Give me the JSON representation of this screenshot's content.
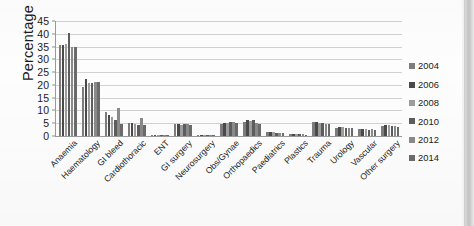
{
  "chart_data": {
    "type": "bar",
    "title": "",
    "xlabel": "",
    "ylabel": "Percentage",
    "ylim": [
      0,
      45
    ],
    "ytick_step": 5,
    "yticks": [
      0,
      5,
      10,
      15,
      20,
      25,
      30,
      35,
      40,
      45
    ],
    "grid": true,
    "legend_position": "right",
    "categories": [
      "Anaemia",
      "Haematology",
      "GI bleed",
      "Cardiothoracic",
      "ENT",
      "GI surgery",
      "Neurosurgery",
      "Obs/Gynae",
      "Orthopaedics",
      "Paediatrics",
      "Plastics",
      "Trauma",
      "Urology",
      "Vascular",
      "Other surgery"
    ],
    "series": [
      {
        "name": "2004",
        "color": "#7d7d7d",
        "values": [
          35.5,
          19.0,
          9.5,
          5.0,
          0.4,
          4.6,
          0.4,
          4.6,
          5.4,
          1.4,
          0.7,
          5.4,
          3.2,
          2.6,
          4.0
        ]
      },
      {
        "name": "2006",
        "color": "#4a4a4a",
        "values": [
          35.8,
          22.4,
          8.2,
          5.2,
          0.4,
          4.6,
          0.5,
          5.2,
          6.2,
          1.5,
          0.8,
          5.6,
          3.6,
          2.8,
          4.4
        ]
      },
      {
        "name": "2008",
        "color": "#9d9d9d",
        "values": [
          36.2,
          20.6,
          7.4,
          4.6,
          0.4,
          4.5,
          0.4,
          5.0,
          6.0,
          1.4,
          0.7,
          5.2,
          3.4,
          2.6,
          4.2
        ]
      },
      {
        "name": "2010",
        "color": "#5d5d5d",
        "values": [
          40.3,
          20.6,
          6.2,
          4.2,
          0.5,
          4.6,
          0.4,
          5.4,
          6.4,
          1.3,
          0.6,
          5.0,
          3.0,
          2.4,
          4.0
        ]
      },
      {
        "name": "2012",
        "color": "#8a8a8a",
        "values": [
          35.0,
          21.0,
          11.0,
          7.2,
          0.4,
          4.6,
          0.4,
          5.6,
          5.2,
          1.2,
          0.6,
          4.8,
          3.2,
          2.6,
          3.8
        ]
      },
      {
        "name": "2014",
        "color": "#6b6b6b",
        "values": [
          34.8,
          21.0,
          4.8,
          4.4,
          0.4,
          4.5,
          0.4,
          5.0,
          4.6,
          1.1,
          0.5,
          4.6,
          3.0,
          2.4,
          3.6
        ]
      }
    ]
  },
  "legend": {
    "items": [
      {
        "label": "2004",
        "color": "#7d7d7d"
      },
      {
        "label": "2006",
        "color": "#4a4a4a"
      },
      {
        "label": "2008",
        "color": "#9d9d9d"
      },
      {
        "label": "2010",
        "color": "#5d5d5d"
      },
      {
        "label": "2012",
        "color": "#8a8a8a"
      },
      {
        "label": "2014",
        "color": "#6b6b6b"
      }
    ]
  }
}
